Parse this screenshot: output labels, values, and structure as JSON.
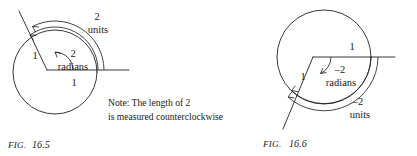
{
  "page": {
    "background_color": "#ffffff",
    "ink_color": "#222222"
  },
  "figures": [
    {
      "id": "fig-16-5",
      "caption_prefix": "FIG.",
      "caption_number": "16.5",
      "circle": {
        "cx": 55,
        "cy": 72,
        "r": 42
      },
      "vertex": {
        "x": 47,
        "y": 70
      },
      "labels": {
        "radius_initial": "1",
        "radius_terminal": "1",
        "angle_value": "2",
        "angle_unit": "radians",
        "arc_value": "2",
        "arc_unit": "units"
      },
      "note": {
        "line1": "Note: The length of 2",
        "line2": "is measured counterclockwise"
      }
    },
    {
      "id": "fig-16-6",
      "caption_prefix": "FIG.",
      "caption_number": "16.6",
      "circle": {
        "cx": 324,
        "cy": 57,
        "r": 47
      },
      "vertex": {
        "x": 313,
        "y": 57
      },
      "labels": {
        "radius_initial": "1",
        "radius_terminal": "1",
        "angle_value": "–2",
        "angle_unit": "radians",
        "arc_value": "–2",
        "arc_unit": "units"
      }
    }
  ]
}
